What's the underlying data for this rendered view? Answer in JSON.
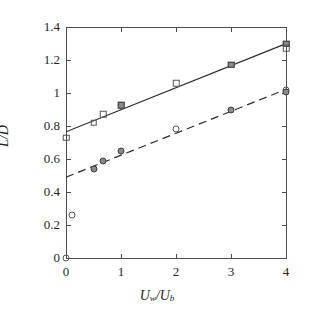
{
  "chart_data": {
    "type": "scatter",
    "title": "",
    "xlabel": "U_w/U_b",
    "xlabel_main": "U",
    "xlabel_sub1": "w",
    "xlabel_slash": "/U",
    "xlabel_sub2": "b",
    "ylabel": "L/D",
    "xlim": [
      0,
      4
    ],
    "ylim": [
      0,
      1.4
    ],
    "grid": false,
    "legend": "none",
    "xticks": [
      0,
      1,
      2,
      3,
      4
    ],
    "xticklabels": [
      "0",
      "1",
      "2",
      "3",
      "4"
    ],
    "yticks": [
      0,
      0.2,
      0.4,
      0.6,
      0.8,
      1.0,
      1.2,
      1.4
    ],
    "yticklabels": [
      "0",
      "0.2",
      "0.4",
      "0.6",
      "0.8",
      "1",
      "1.2",
      "1.4"
    ],
    "series": [
      {
        "name": "square-series",
        "marker": "square",
        "line_style": "solid",
        "line_color": "#2b2b2b",
        "fit_intercept": 0.765,
        "fit_slope": 0.1335,
        "points": [
          {
            "x": 0.0,
            "y": 0.73,
            "filled": false
          },
          {
            "x": 0.5,
            "y": 0.82,
            "filled": false
          },
          {
            "x": 0.68,
            "y": 0.87,
            "filled": false
          },
          {
            "x": 1.0,
            "y": 0.925,
            "filled": true
          },
          {
            "x": 2.0,
            "y": 1.06,
            "filled": false
          },
          {
            "x": 3.0,
            "y": 1.17,
            "filled": true
          },
          {
            "x": 4.0,
            "y": 1.3,
            "filled": true
          },
          {
            "x": 4.0,
            "y": 1.27,
            "filled": false
          }
        ]
      },
      {
        "name": "circle-series",
        "marker": "circle",
        "line_style": "dashed",
        "line_color": "#2b2b2b",
        "fit_intercept": 0.49,
        "fit_slope": 0.133,
        "points": [
          {
            "x": 0.0,
            "y": 0.0,
            "filled": false
          },
          {
            "x": 0.1,
            "y": 0.26,
            "filled": false
          },
          {
            "x": 0.5,
            "y": 0.54,
            "filled": true
          },
          {
            "x": 0.68,
            "y": 0.59,
            "filled": true
          },
          {
            "x": 1.0,
            "y": 0.65,
            "filled": true
          },
          {
            "x": 2.0,
            "y": 0.78,
            "filled": false
          },
          {
            "x": 3.0,
            "y": 0.9,
            "filled": true
          },
          {
            "x": 4.0,
            "y": 1.02,
            "filled": false
          },
          {
            "x": 4.0,
            "y": 1.005,
            "filled": true
          }
        ]
      }
    ]
  },
  "axes": {
    "colors": {
      "axis": "#4d4d4d",
      "text": "#231f20",
      "marker_fill": "#8a8a8a",
      "marker_edge": "#555555",
      "line": "#2b2b2b",
      "background": "#ffffff"
    }
  }
}
